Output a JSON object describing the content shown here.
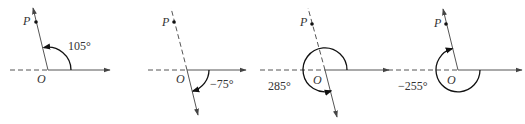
{
  "figure": {
    "diagrams": [
      {
        "point_label": "P",
        "origin_label": "O",
        "angle_label": "105°",
        "angle_deg": 105
      },
      {
        "point_label": "P",
        "origin_label": "O",
        "angle_label": "−75°",
        "angle_deg": -75
      },
      {
        "point_label": "P",
        "origin_label": "O",
        "angle_label": "285°",
        "angle_deg": 285
      },
      {
        "point_label": "P",
        "origin_label": "O",
        "angle_label": "−255°",
        "angle_deg": -255
      }
    ],
    "colors": {
      "stroke": "#555555",
      "arc": "#111111"
    }
  }
}
